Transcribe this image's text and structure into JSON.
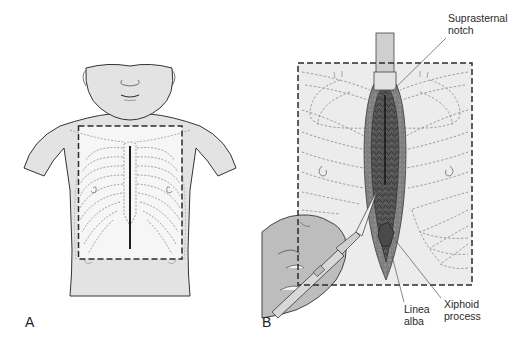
{
  "figure": {
    "panels": [
      {
        "id": "A",
        "letter": "A",
        "description": "Child torso with dashed rectangle outlining the chest wall and a vertical midline sternotomy incision line"
      },
      {
        "id": "B",
        "letter": "B",
        "description": "Close-up of the opened midline incision over the sternum, scalpel held in the hand, retractor at the top"
      }
    ],
    "labels": {
      "suprasternal_notch": "Suprasternal notch",
      "suprasternal_line1": "Suprasternal",
      "suprasternal_line2": "notch",
      "linea_alba_line1": "Linea",
      "linea_alba_line2": "alba",
      "xiphoid_line1": "Xiphoid",
      "xiphoid_line2": "process"
    },
    "colors": {
      "skin": "#e3e3e3",
      "outline": "#333333",
      "dashed_box": "#2b2b2b",
      "ribs": "#7a7a7a",
      "incision_dark": "#3a3a3a",
      "incision_mid": "#6b6b6b",
      "chest_field": "#f2f2f2",
      "hand": "#bdbdbd"
    }
  }
}
